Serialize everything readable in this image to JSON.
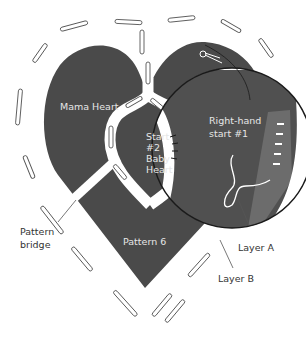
{
  "diagram": {
    "colors": {
      "fabric": "#4a4a4a",
      "fabric_zoom": "#505050",
      "layer_a": "#6c6c6c",
      "outline": "#1a1a1a",
      "bridge": "#ffffff",
      "text_on_dark": "#e6e6e6",
      "text_on_light": "#333333"
    },
    "labels": {
      "mama_heart": "Mama Heart",
      "start2_line1": "Start",
      "start2_line2": "#2",
      "start2_line3": "Baby",
      "start2_line4": "Heart",
      "right_hand_line1": "Right-hand",
      "right_hand_line2": "start #1",
      "pattern_bridge_line1": "Pattern",
      "pattern_bridge_line2": "bridge",
      "pattern6": "Pattern 6",
      "layer_a": "Layer A",
      "layer_b": "Layer B"
    }
  }
}
